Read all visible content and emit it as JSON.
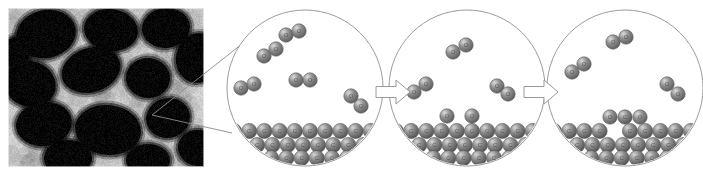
{
  "figure": {
    "title": "Oxidation mechanism schematic of porous carbon surface",
    "panel_label": "",
    "caption": ""
  },
  "micrograph": {
    "name": "SEM micrograph of porous carbon foam",
    "modality": "SEM",
    "x": 8,
    "y": 8,
    "width": 196,
    "height": 159,
    "background_color": "#050505",
    "pore_color": "#080808",
    "ligament_color": "#cfcfcf",
    "border_color": "#ffffff",
    "pores": [
      {
        "cx": 38,
        "cy": 26,
        "rx": 30,
        "ry": 24,
        "rot": -12
      },
      {
        "cx": 103,
        "cy": 22,
        "rx": 27,
        "ry": 21,
        "rot": 8
      },
      {
        "cx": 158,
        "cy": 20,
        "rx": 24,
        "ry": 20,
        "rot": -6
      },
      {
        "cx": 190,
        "cy": 50,
        "rx": 22,
        "ry": 25,
        "rot": 14
      },
      {
        "cx": 22,
        "cy": 76,
        "rx": 26,
        "ry": 23,
        "rot": 20
      },
      {
        "cx": 83,
        "cy": 62,
        "rx": 30,
        "ry": 22,
        "rot": -18
      },
      {
        "cx": 140,
        "cy": 70,
        "rx": 22,
        "ry": 20,
        "rot": 4
      },
      {
        "cx": 36,
        "cy": 116,
        "rx": 28,
        "ry": 22,
        "rot": -8
      },
      {
        "cx": 100,
        "cy": 122,
        "rx": 33,
        "ry": 25,
        "rot": 6
      },
      {
        "cx": 160,
        "cy": 110,
        "rx": 22,
        "ry": 20,
        "rot": -12
      },
      {
        "cx": 190,
        "cy": 140,
        "rx": 20,
        "ry": 18,
        "rot": 10
      },
      {
        "cx": 60,
        "cy": 150,
        "rx": 24,
        "ry": 18,
        "rot": 0
      },
      {
        "cx": 140,
        "cy": 152,
        "rx": 22,
        "ry": 16,
        "rot": 0
      },
      {
        "cx": 8,
        "cy": 45,
        "rx": 14,
        "ry": 16,
        "rot": 0
      }
    ]
  },
  "callout": {
    "name": "magnification-leader-lines",
    "origin": {
      "x": 152,
      "y": 115
    },
    "targets": [
      {
        "x": 252,
        "y": 36
      },
      {
        "x": 232,
        "y": 133
      }
    ],
    "stroke": "#8a8a8a",
    "stroke_width": 0.9
  },
  "style": {
    "circle_stroke": "#9a9a9a",
    "circle_stroke_width": 1.0,
    "circle_fill": "#ffffff",
    "arrow_stroke": "#9a9a9a",
    "arrow_fill": "#ffffff",
    "atom_oxygen_color": "#8e8e8e",
    "atom_oxygen_highlight": "#dcdcdc",
    "atom_oxygen_shadow": "#5a5a5a",
    "atom_carbon_color": "#8a8a8a",
    "atom_carbon_highlight": "#d6d6d6",
    "atom_carbon_shadow": "#4e4e4e",
    "atom_stroke": "#585858",
    "atom_label_color": "#404040",
    "atom_radius_gas": 7.2,
    "atom_radius_surface": 7.6
  },
  "legend": {
    "oxygen_label": "O",
    "carbon_label": "C"
  },
  "panels": [
    {
      "id": "panel-1",
      "name": "o2-approach-panel",
      "stage_label": "O2 molecules approach carbon surface",
      "circle": {
        "cx": 305,
        "cy": 88,
        "r": 78
      },
      "substrate": {
        "name": "carbon-substrate",
        "atom_label": "C",
        "rows": [
          {
            "y": 131,
            "x_start": 234,
            "count": 10,
            "spacing": 15.2,
            "vacancies": []
          },
          {
            "y": 145,
            "x_start": 242,
            "count": 9,
            "spacing": 15.2,
            "vacancies": []
          },
          {
            "y": 158,
            "x_start": 256,
            "count": 7,
            "spacing": 15.2,
            "vacancies": []
          }
        ]
      },
      "molecules": [
        {
          "name": "o2-molecule",
          "label": "O2",
          "atoms": [
            {
              "element": "O",
              "x": 264,
              "y": 56
            },
            {
              "element": "O",
              "x": 276,
              "y": 49
            }
          ]
        },
        {
          "name": "o2-molecule",
          "label": "O2",
          "atoms": [
            {
              "element": "O",
              "x": 286,
              "y": 35
            },
            {
              "element": "O",
              "x": 299,
              "y": 31
            }
          ]
        },
        {
          "name": "o2-molecule",
          "label": "O2",
          "atoms": [
            {
              "element": "O",
              "x": 241,
              "y": 88
            },
            {
              "element": "O",
              "x": 254,
              "y": 84
            }
          ]
        },
        {
          "name": "o2-molecule",
          "label": "O2",
          "atoms": [
            {
              "element": "O",
              "x": 296,
              "y": 80
            },
            {
              "element": "O",
              "x": 310,
              "y": 80
            }
          ]
        },
        {
          "name": "o2-molecule",
          "label": "O2",
          "atoms": [
            {
              "element": "O",
              "x": 351,
              "y": 96
            },
            {
              "element": "O",
              "x": 361,
              "y": 106
            }
          ]
        }
      ],
      "adsorbed": []
    },
    {
      "id": "panel-2",
      "name": "o2-dissociation-panel",
      "stage_label": "O2 dissociates and adsorbs on carbon surface",
      "circle": {
        "cx": 467,
        "cy": 88,
        "r": 78
      },
      "substrate": {
        "name": "carbon-substrate",
        "atom_label": "C",
        "rows": [
          {
            "y": 131,
            "x_start": 396,
            "count": 10,
            "spacing": 15.2,
            "vacancies": []
          },
          {
            "y": 145,
            "x_start": 404,
            "count": 9,
            "spacing": 15.2,
            "vacancies": []
          },
          {
            "y": 158,
            "x_start": 418,
            "count": 7,
            "spacing": 15.2,
            "vacancies": []
          }
        ]
      },
      "molecules": [
        {
          "name": "o2-molecule",
          "label": "O2",
          "atoms": [
            {
              "element": "O",
              "x": 453,
              "y": 52
            },
            {
              "element": "O",
              "x": 466,
              "y": 45
            }
          ]
        },
        {
          "name": "o2-molecule",
          "label": "O2",
          "atoms": [
            {
              "element": "O",
              "x": 414,
              "y": 92
            },
            {
              "element": "O",
              "x": 426,
              "y": 84
            }
          ]
        },
        {
          "name": "o2-molecule",
          "label": "O2",
          "atoms": [
            {
              "element": "O",
              "x": 497,
              "y": 86
            },
            {
              "element": "O",
              "x": 508,
              "y": 94
            }
          ]
        }
      ],
      "adsorbed": [
        {
          "name": "adsorbed-oxygen-atom",
          "element": "O",
          "x": 447,
          "y": 116
        },
        {
          "name": "adsorbed-oxygen-atom",
          "element": "O",
          "x": 472,
          "y": 116
        }
      ]
    },
    {
      "id": "panel-3",
      "name": "co2-desorption-panel",
      "stage_label": "CO2 forms and desorbs leaving a carbon vacancy",
      "circle": {
        "cx": 625,
        "cy": 88,
        "r": 78
      },
      "substrate": {
        "name": "carbon-substrate",
        "atom_label": "C",
        "rows": [
          {
            "y": 131,
            "x_start": 554,
            "count": 10,
            "spacing": 15.2,
            "vacancies": [
              4
            ]
          },
          {
            "y": 145,
            "x_start": 562,
            "count": 9,
            "spacing": 15.2,
            "vacancies": []
          },
          {
            "y": 158,
            "x_start": 576,
            "count": 7,
            "spacing": 15.2,
            "vacancies": []
          }
        ]
      },
      "molecules": [
        {
          "name": "o2-molecule",
          "label": "O2",
          "atoms": [
            {
              "element": "O",
              "x": 613,
              "y": 42
            },
            {
              "element": "O",
              "x": 626,
              "y": 37
            }
          ]
        },
        {
          "name": "o2-molecule",
          "label": "O2",
          "atoms": [
            {
              "element": "O",
              "x": 572,
              "y": 72
            },
            {
              "element": "O",
              "x": 584,
              "y": 64
            }
          ]
        },
        {
          "name": "o2-molecule",
          "label": "O2",
          "atoms": [
            {
              "element": "O",
              "x": 667,
              "y": 84
            },
            {
              "element": "O",
              "x": 678,
              "y": 94
            }
          ]
        }
      ],
      "adsorbed": [
        {
          "name": "co2-molecule",
          "label": "CO2",
          "atoms": [
            {
              "element": "O",
              "x": 610,
              "y": 117
            },
            {
              "element": "C",
              "x": 625,
              "y": 117
            },
            {
              "element": "O",
              "x": 640,
              "y": 117
            }
          ]
        }
      ]
    }
  ],
  "arrows": [
    {
      "name": "process-arrow-1",
      "x": 376,
      "y": 92,
      "length": 34,
      "body_height": 11,
      "head_width": 14,
      "head_height": 24
    },
    {
      "name": "process-arrow-2",
      "x": 524,
      "y": 92,
      "length": 34,
      "body_height": 11,
      "head_width": 14,
      "head_height": 24
    }
  ]
}
